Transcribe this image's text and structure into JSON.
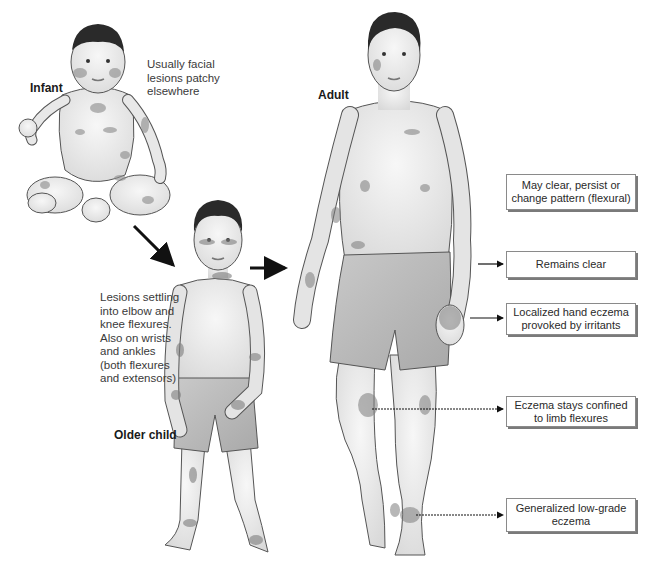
{
  "diagram": {
    "type": "illustrated progression of atopic eczema distribution by age",
    "stages": [
      {
        "id": "infant",
        "label": "Infant",
        "note": "Usually facial\nlesions patchy\nelsewhere"
      },
      {
        "id": "older-child",
        "label": "Older child",
        "note": "Lesions settling\ninto elbow and\nknee flexures.\nAlso on wrists\nand ankles\n(both flexures\nand extensors)"
      },
      {
        "id": "adult",
        "label": "Adult"
      }
    ],
    "callouts": [
      {
        "id": "face",
        "text": "May clear, persist or\nchange pattern (flexural)"
      },
      {
        "id": "trunk",
        "text": "Remains clear"
      },
      {
        "id": "hands",
        "text": "Localized hand eczema\nprovoked by irritants"
      },
      {
        "id": "limbs",
        "text": "Eczema stays confined\nto limb flexures"
      },
      {
        "id": "ankles",
        "text": "Generalized low-grade\neczema"
      }
    ],
    "colors": {
      "skin": "#ebebeb",
      "outline": "#555555",
      "lesion": "#8a8a8a",
      "hair": "#2a2a2a",
      "shorts": "#bdbdbd",
      "arrow": "#111111"
    }
  }
}
